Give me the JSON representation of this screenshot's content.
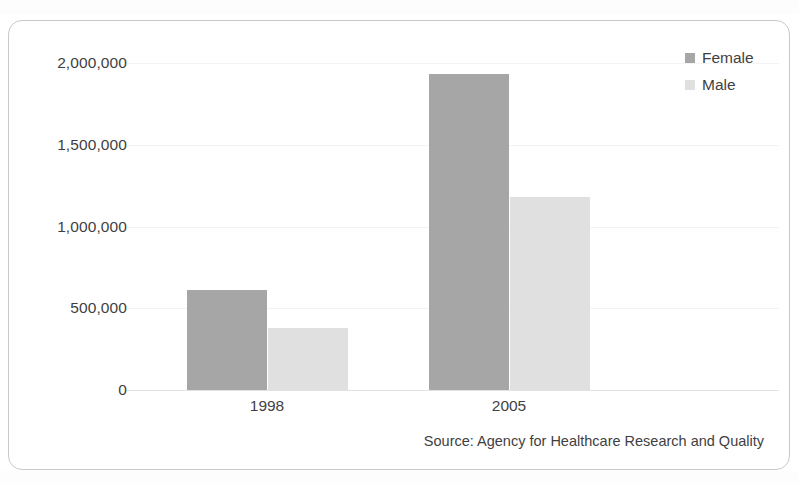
{
  "chart_data": {
    "type": "bar",
    "title": "",
    "subtitle": "",
    "xlabel": "",
    "ylabel": "",
    "categories": [
      "1998",
      "2005"
    ],
    "series": [
      {
        "name": "Female",
        "color": "#a6a6a6",
        "values": [
          610000,
          1930000
        ]
      },
      {
        "name": "Male",
        "color": "#e0e0e0",
        "values": [
          378000,
          1180000
        ]
      }
    ],
    "ylim": [
      0,
      2000000
    ],
    "yticks": [
      0,
      500000,
      1000000,
      1500000,
      2000000
    ],
    "ytick_labels": [
      "0",
      "500,000",
      "1,000,000",
      "1,500,000",
      "2,000,000"
    ],
    "grid": true,
    "legend_position": "top-right",
    "annotations": [
      "Source: Agency for Healthcare Research and Quality"
    ]
  },
  "legend": {
    "items": [
      {
        "label": "Female",
        "color": "#a6a6a6"
      },
      {
        "label": "Male",
        "color": "#e0e0e0"
      }
    ]
  },
  "source": {
    "text": "Source: Agency for Healthcare Research and Quality"
  },
  "colors": {
    "female": "#a6a6a6",
    "male": "#e0e0e0",
    "text": "#3f3f3f",
    "frame": "#c9c9c9",
    "axis": "#e3e3e3",
    "grid": "#f3f3f3",
    "background": "#ffffff"
  }
}
